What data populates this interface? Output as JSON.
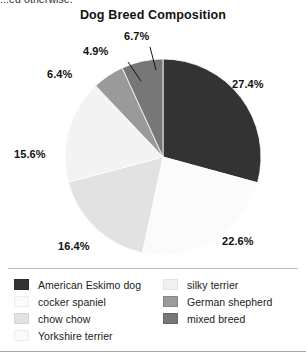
{
  "caption": {
    "truncated_text": "...ed otherwise."
  },
  "chart_data": {
    "type": "pie",
    "title": "Dog Breed Composition",
    "xlabel": "",
    "ylabel": "",
    "grid": false,
    "legend_position": "bottom",
    "start_angle_deg": 0,
    "direction": "clockwise",
    "categories": [
      "American Eskimo dog",
      "cocker spaniel",
      "chow chow",
      "Yorkshire terrier",
      "silky terrier",
      "German shepherd",
      "mixed breed"
    ],
    "values": [
      27.4,
      22.6,
      16.4,
      15.6,
      0.4,
      4.9,
      6.4
    ],
    "value_unit": "%",
    "colors": [
      "#333333",
      "#fbfbfb",
      "#e2e2e2",
      "#f3f3f3",
      "#f0f0f0",
      "#9a9a9a",
      "#777777"
    ],
    "slices": [
      {
        "label": "American Eskimo dog",
        "value": 27.4,
        "display": "27.4%",
        "color": "#333333",
        "labelled": true
      },
      {
        "label": "cocker spaniel",
        "value": 22.6,
        "display": "22.6%",
        "color": "#fbfbfb",
        "labelled": true
      },
      {
        "label": "chow chow",
        "value": 16.4,
        "display": "16.4%",
        "color": "#e2e2e2",
        "labelled": true
      },
      {
        "label": "Yorkshire terrier",
        "value": 15.6,
        "display": "15.6%",
        "color": "#f3f3f3",
        "labelled": true
      },
      {
        "label": "silky terrier",
        "value": 0.4,
        "display": "",
        "color": "#f0f0f0",
        "labelled": false
      },
      {
        "label": "German shepherd",
        "value": 4.9,
        "display": "4.9%",
        "color": "#9a9a9a",
        "labelled": true
      },
      {
        "label": "mixed breed",
        "value": 6.4,
        "display": "6.4%",
        "color": "#777777",
        "labelled": true
      }
    ],
    "callout_labels": [
      {
        "text": "27.4%"
      },
      {
        "text": "22.6%"
      },
      {
        "text": "16.4%"
      },
      {
        "text": "15.6%"
      },
      {
        "text": "6.4%"
      },
      {
        "text": "4.9%"
      },
      {
        "text": "6.7%"
      }
    ]
  },
  "labels": {
    "american_eskimo": "27.4%",
    "cocker_spaniel": "22.6%",
    "chow_chow": "16.4%",
    "yorkshire": "15.6%",
    "mixed_breed": "6.4%",
    "german_shepherd": "4.9%",
    "silky_group": "6.7%"
  },
  "legend": {
    "columns": [
      {
        "items": [
          {
            "label": "American Eskimo dog",
            "color": "#333333"
          },
          {
            "label": "cocker spaniel",
            "color": "#fbfbfb"
          },
          {
            "label": "chow chow",
            "color": "#e2e2e2"
          },
          {
            "label": "Yorkshire terrier",
            "color": "#fafafa"
          }
        ]
      },
      {
        "items": [
          {
            "label": "silky terrier",
            "color": "#f0f0f0"
          },
          {
            "label": "German shepherd",
            "color": "#9a9a9a"
          },
          {
            "label": "mixed breed",
            "color": "#777777"
          }
        ]
      }
    ]
  }
}
